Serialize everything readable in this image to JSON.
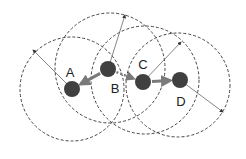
{
  "diagram": {
    "type": "node-range-diagram",
    "colors": {
      "node": "#404040",
      "circle": "#444444",
      "radius_line": "#666666",
      "link_arrow": "#7a7a7a",
      "label": "#222222"
    },
    "nodes": [
      {
        "id": "A",
        "label": "A",
        "cx": 72,
        "cy": 89,
        "r": 8,
        "label_x": 70,
        "label_y": 77
      },
      {
        "id": "B",
        "label": "B",
        "cx": 108,
        "cy": 69,
        "r": 8,
        "label_x": 115,
        "label_y": 93
      },
      {
        "id": "C",
        "label": "C",
        "cx": 143,
        "cy": 82,
        "r": 8,
        "label_x": 143,
        "label_y": 69
      },
      {
        "id": "D",
        "label": "D",
        "cx": 180,
        "cy": 80,
        "r": 8,
        "label_x": 181,
        "label_y": 106
      }
    ],
    "range_circles": [
      {
        "node": "A",
        "cx": 72,
        "cy": 89,
        "r": 52
      },
      {
        "node": "B",
        "cx": 110,
        "cy": 68,
        "r": 55
      },
      {
        "node": "C",
        "cx": 145,
        "cy": 80,
        "r": 54
      },
      {
        "node": "D",
        "cx": 178,
        "cy": 85,
        "r": 52
      }
    ],
    "radius_arrows": [
      {
        "node": "A",
        "x1": 72,
        "y1": 89,
        "x2": 33,
        "y2": 50
      },
      {
        "node": "B",
        "x1": 108,
        "y1": 69,
        "x2": 125,
        "y2": 15
      },
      {
        "node": "C",
        "x1": 143,
        "y1": 82,
        "x2": 181,
        "y2": 42
      },
      {
        "node": "D",
        "x1": 180,
        "y1": 80,
        "x2": 223,
        "y2": 112
      }
    ],
    "links": [
      {
        "from": "B",
        "to": "A",
        "style": "solid-thick"
      },
      {
        "from": "B",
        "to": "C",
        "style": "dotted"
      },
      {
        "from": "C",
        "to": "D",
        "style": "solid-thick"
      }
    ]
  }
}
